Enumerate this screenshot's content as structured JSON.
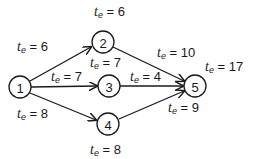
{
  "diagram": {
    "type": "pert-network",
    "nodes": [
      {
        "id": "1",
        "label": "1",
        "cx": 20,
        "cy": 87
      },
      {
        "id": "2",
        "label": "2",
        "cx": 103,
        "cy": 42
      },
      {
        "id": "3",
        "label": "3",
        "cx": 109,
        "cy": 86
      },
      {
        "id": "4",
        "label": "4",
        "cx": 108,
        "cy": 124
      },
      {
        "id": "5",
        "label": "5",
        "cx": 195,
        "cy": 86
      }
    ],
    "edges": [
      {
        "from": "1",
        "to": "2",
        "label": "t_e = 6"
      },
      {
        "from": "1",
        "to": "3",
        "label": "t_e = 7"
      },
      {
        "from": "1",
        "to": "4",
        "label": "t_e = 8"
      },
      {
        "from": "2",
        "to": "5",
        "label": "t_e = 10"
      },
      {
        "from": "3",
        "to": "5",
        "label": "t_e = 4"
      },
      {
        "from": "4",
        "to": "5",
        "label": "t_e = 9"
      }
    ],
    "labels": {
      "top": {
        "var": "t",
        "sub": "e",
        "eq": " = 6"
      },
      "e12": {
        "var": "t",
        "sub": "e",
        "eq": " = 6"
      },
      "node2_below": {
        "var": "t",
        "sub": "e",
        "eq": " = 7"
      },
      "e13": {
        "var": "t",
        "sub": "e",
        "eq": " = 7"
      },
      "e35": {
        "var": "t",
        "sub": "e",
        "eq": " = 4"
      },
      "e25": {
        "var": "t",
        "sub": "e",
        "eq": " = 10"
      },
      "node5_above": {
        "var": "t",
        "sub": "e",
        "eq": " = 17"
      },
      "node1_below": {
        "var": "t",
        "sub": "e",
        "eq": " = 8"
      },
      "node5_below": {
        "var": "t",
        "sub": "e",
        "eq": " = 9"
      },
      "node4_below": {
        "var": "t",
        "sub": "e",
        "eq": " = 8"
      }
    }
  }
}
